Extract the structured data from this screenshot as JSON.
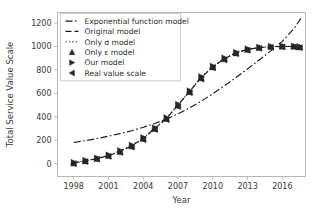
{
  "chart_data": {
    "type": "line",
    "title": "",
    "xlabel": "Year",
    "ylabel": "Total Service Value Scale",
    "xlim": [
      1996.6,
      2018.0
    ],
    "ylim": [
      -110,
      1290
    ],
    "xticks": [
      1998,
      2001,
      2004,
      2007,
      2010,
      2013,
      2016
    ],
    "yticks": [
      0,
      200,
      400,
      600,
      800,
      1000,
      1200
    ],
    "grid": false,
    "legend_position": "upper left",
    "series": [
      {
        "name": "Exponential function model",
        "style": "dashdot",
        "marker": "none",
        "x": [
          1998,
          1999,
          2000,
          2001,
          2002,
          2003,
          2004,
          2005,
          2006,
          2007,
          2008,
          2009,
          2010,
          2011,
          2012,
          2013,
          2014,
          2015,
          2016,
          2017,
          2017.6
        ],
        "values": [
          180,
          196,
          214,
          234,
          256,
          281,
          310,
          343,
          381,
          425,
          476,
          533,
          596,
          664,
          735,
          808,
          884,
          962,
          1044,
          1152,
          1240
        ]
      },
      {
        "name": "Original model",
        "style": "dashed",
        "marker": "none",
        "x": [
          1998,
          1999,
          2000,
          2001,
          2002,
          2003,
          2004,
          2005,
          2006,
          2007,
          2008,
          2009,
          2010,
          2011,
          2012,
          2013,
          2014,
          2015,
          2016,
          2017,
          2017.5
        ],
        "values": [
          5,
          22,
          42,
          68,
          104,
          152,
          215,
          300,
          385,
          500,
          615,
          735,
          825,
          895,
          945,
          975,
          990,
          998,
          1000,
          1000,
          995
        ]
      },
      {
        "name": "Only σ model",
        "style": "dotted",
        "marker": "none",
        "x": [
          1998,
          1999,
          2000,
          2001,
          2002,
          2003,
          2004,
          2005,
          2006,
          2007,
          2008,
          2009,
          2010,
          2011,
          2012,
          2013,
          2014,
          2015,
          2016,
          2017,
          2017.5
        ],
        "values": [
          8,
          25,
          45,
          72,
          108,
          155,
          218,
          302,
          388,
          502,
          618,
          738,
          828,
          898,
          947,
          977,
          991,
          999,
          1001,
          1001,
          996
        ]
      },
      {
        "name": "Only ε model",
        "style": "none",
        "marker": "triangle-up",
        "x": [
          1998,
          1999,
          2000,
          2001,
          2002,
          2003,
          2004,
          2005,
          2006,
          2007,
          2008,
          2009,
          2010,
          2011,
          2012,
          2013,
          2014,
          2015,
          2016,
          2017,
          2017.5
        ],
        "values": [
          2,
          20,
          40,
          66,
          100,
          148,
          212,
          296,
          382,
          496,
          612,
          730,
          822,
          892,
          942,
          972,
          988,
          996,
          999,
          999,
          993
        ]
      },
      {
        "name": "Our model",
        "style": "none",
        "marker": "triangle-right",
        "x": [
          1998,
          1999,
          2000,
          2001,
          2002,
          2003,
          2004,
          2005,
          2006,
          2007,
          2008,
          2009,
          2010,
          2011,
          2012,
          2013,
          2014,
          2015,
          2016,
          2017,
          2017.5
        ],
        "values": [
          10,
          28,
          48,
          74,
          112,
          158,
          222,
          306,
          392,
          506,
          622,
          742,
          832,
          902,
          950,
          980,
          994,
          1002,
          1004,
          1003,
          998
        ]
      },
      {
        "name": "Real value scale",
        "style": "none",
        "marker": "triangle-left",
        "x": [
          1998,
          1999,
          2000,
          2001,
          2002,
          2003,
          2004,
          2005,
          2006,
          2007,
          2008,
          2009,
          2010,
          2011,
          2012,
          2013,
          2014,
          2015,
          2016,
          2017,
          2017.5
        ],
        "values": [
          0,
          18,
          38,
          62,
          96,
          140,
          205,
          292,
          376,
          488,
          605,
          722,
          818,
          886,
          938,
          968,
          985,
          993,
          997,
          996,
          990
        ]
      }
    ]
  },
  "axes": {
    "xlabel": "Year",
    "ylabel": "Total Service Value Scale",
    "xticks": [
      "1998",
      "2001",
      "2004",
      "2007",
      "2010",
      "2013",
      "2016"
    ],
    "yticks": [
      "0",
      "200",
      "400",
      "600",
      "800",
      "1000",
      "1200"
    ]
  },
  "legend": {
    "items": [
      {
        "label": "Exponential function model",
        "glyph": "dashdot-line-icon"
      },
      {
        "label": "Original model",
        "glyph": "dashed-line-icon"
      },
      {
        "label": "Only σ model",
        "glyph": "dotted-line-icon"
      },
      {
        "label": "Only ε model",
        "glyph": "triangle-up-icon"
      },
      {
        "label": "Our model",
        "glyph": "triangle-right-icon"
      },
      {
        "label": "Real value scale",
        "glyph": "triangle-left-icon"
      }
    ]
  },
  "colors": {
    "line": "#1a1a1a",
    "spine": "#b8b8b8",
    "text": "#3a3a3a",
    "background": "#ffffff"
  }
}
